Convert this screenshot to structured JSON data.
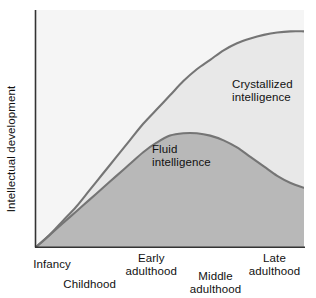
{
  "chart_data": {
    "type": "area",
    "title": "",
    "subtitle": "",
    "xlabel": "",
    "ylabel": "Intellectual development",
    "grid": false,
    "legend_position": "inline-annotations",
    "xlim": [
      0,
      100
    ],
    "ylim": [
      0,
      100
    ],
    "axis_ticks_shown": false,
    "x_tick_labels": [
      {
        "label": "Infancy",
        "x_pct": 6
      },
      {
        "label": "Childhood",
        "x_pct": 20
      },
      {
        "label": "Early\nadulthood",
        "x_pct": 43
      },
      {
        "label": "Middle\nadulthood",
        "x_pct": 67
      },
      {
        "label": "Late\nadulthood",
        "x_pct": 89
      }
    ],
    "series": [
      {
        "name": "Crystallized intelligence",
        "annotation": "Crystallized\nintelligence",
        "line_color": "#757575",
        "fill_color": "#e8e8e8",
        "x": [
          0,
          5,
          10,
          15,
          20,
          25,
          30,
          35,
          40,
          45,
          50,
          55,
          60,
          65,
          70,
          75,
          80,
          85,
          90,
          95,
          100
        ],
        "values": [
          0,
          5,
          11,
          17,
          24,
          31,
          38,
          45,
          52,
          58,
          64,
          70,
          75,
          79,
          83,
          86,
          88,
          89.5,
          90.5,
          91,
          91
        ]
      },
      {
        "name": "Fluid intelligence",
        "annotation": "Fluid\nintelligence",
        "line_color": "#757575",
        "fill_color": "#b8b8b8",
        "x": [
          0,
          5,
          10,
          15,
          20,
          25,
          30,
          35,
          40,
          45,
          50,
          55,
          60,
          65,
          70,
          75,
          80,
          85,
          90,
          95,
          100
        ],
        "values": [
          0,
          5,
          10,
          15,
          20,
          25,
          30,
          35,
          40,
          44,
          47,
          48,
          48,
          47,
          45,
          42,
          38,
          34,
          30,
          27,
          25
        ]
      }
    ],
    "background_above_curves": "#f5f5f5",
    "annotations": [
      {
        "text": "Crystallized\nintelligence",
        "x_px": 232,
        "y_px": 78
      },
      {
        "text": "Fluid\nintelligence",
        "x_px": 152,
        "y_px": 143
      }
    ]
  },
  "axis": {
    "y_axis_label": "Intellectual development",
    "y_axis_color": "#333333",
    "x_axis_color": "#333333"
  }
}
